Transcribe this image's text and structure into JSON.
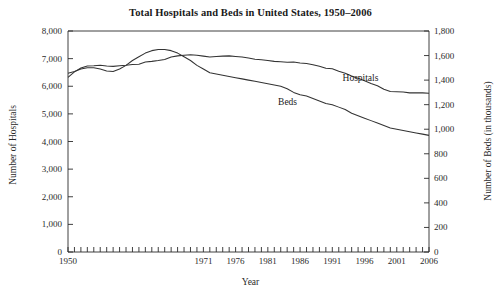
{
  "chart_data": {
    "type": "line",
    "title": "Total Hospitals and Beds in United States, 1950–2006",
    "xlabel": "Year",
    "ylabel_left": "Number of Hospitals",
    "ylabel_right": "Number of Beds (in thousands)",
    "xlim": [
      1950,
      2006
    ],
    "ylim_left": [
      0,
      8000
    ],
    "ylim_right": [
      0,
      1800
    ],
    "grid": false,
    "legend_position": "inline-labels",
    "xticks": [
      1950,
      1971,
      1976,
      1981,
      1986,
      1991,
      1996,
      2001,
      2006
    ],
    "xtick_labels": [
      "1950",
      "1971",
      "1976",
      "1981",
      "1986",
      "1991",
      "1996",
      "2001",
      "2006"
    ],
    "xminor_tick_interval": 1,
    "yticks_left": [
      0,
      1000,
      2000,
      3000,
      4000,
      5000,
      6000,
      7000,
      8000
    ],
    "ytick_labels_left": [
      "0",
      "1,000",
      "2,000",
      "3,000",
      "4,000",
      "5,000",
      "6,000",
      "7,000",
      "8,000"
    ],
    "yticks_right": [
      0,
      200,
      400,
      600,
      800,
      1000,
      1200,
      1400,
      1600,
      1800
    ],
    "ytick_labels_right": [
      "0",
      "200",
      "400",
      "600",
      "800",
      "1,000",
      "1,200",
      "1,400",
      "1,600",
      "1,800"
    ],
    "series": [
      {
        "name": "Hospitals",
        "axis": "left",
        "color": "#333333",
        "label_x": 1996,
        "label_y": 6250,
        "x": [
          1950,
          1951,
          1952,
          1953,
          1954,
          1955,
          1956,
          1957,
          1958,
          1959,
          1960,
          1961,
          1962,
          1963,
          1964,
          1965,
          1966,
          1967,
          1968,
          1969,
          1970,
          1971,
          1972,
          1973,
          1974,
          1975,
          1976,
          1977,
          1978,
          1979,
          1980,
          1981,
          1982,
          1983,
          1984,
          1985,
          1986,
          1987,
          1988,
          1989,
          1990,
          1991,
          1992,
          1993,
          1994,
          1995,
          1996,
          1997,
          1998,
          1999,
          2000,
          2001,
          2002,
          2003,
          2004,
          2005,
          2006
        ],
        "y": [
          6320,
          6520,
          6660,
          6730,
          6740,
          6760,
          6730,
          6720,
          6740,
          6760,
          6790,
          6800,
          6880,
          6900,
          6930,
          6970,
          7060,
          7100,
          7120,
          7140,
          7120,
          7090,
          7060,
          7080,
          7090,
          7100,
          7080,
          7060,
          7020,
          6980,
          6960,
          6930,
          6900,
          6890,
          6870,
          6880,
          6840,
          6820,
          6780,
          6720,
          6650,
          6630,
          6540,
          6470,
          6370,
          6290,
          6200,
          6100,
          6020,
          5890,
          5810,
          5800,
          5790,
          5760,
          5760,
          5760,
          5750
        ]
      },
      {
        "name": "Beds",
        "axis": "right",
        "color": "#333333",
        "label_x": 1986,
        "label_y_right": 1210,
        "x": [
          1950,
          1951,
          1952,
          1953,
          1954,
          1955,
          1956,
          1957,
          1958,
          1959,
          1960,
          1961,
          1962,
          1963,
          1964,
          1965,
          1966,
          1967,
          1968,
          1969,
          1970,
          1971,
          1972,
          1973,
          1974,
          1975,
          1976,
          1977,
          1978,
          1979,
          1980,
          1981,
          1982,
          1983,
          1984,
          1985,
          1986,
          1987,
          1988,
          1989,
          1990,
          1991,
          1992,
          1993,
          1994,
          1995,
          1996,
          1997,
          1998,
          1999,
          2000,
          2001,
          2002,
          2003,
          2004,
          2005,
          2006
        ],
        "y": [
          1456,
          1470,
          1490,
          1500,
          1500,
          1490,
          1475,
          1470,
          1490,
          1520,
          1560,
          1590,
          1620,
          1640,
          1650,
          1650,
          1640,
          1620,
          1590,
          1560,
          1520,
          1490,
          1460,
          1450,
          1440,
          1430,
          1420,
          1410,
          1400,
          1390,
          1380,
          1370,
          1360,
          1350,
          1330,
          1300,
          1280,
          1270,
          1250,
          1230,
          1210,
          1200,
          1180,
          1160,
          1130,
          1110,
          1090,
          1070,
          1050,
          1030,
          1010,
          1000,
          990,
          980,
          970,
          960,
          950
        ]
      }
    ]
  }
}
